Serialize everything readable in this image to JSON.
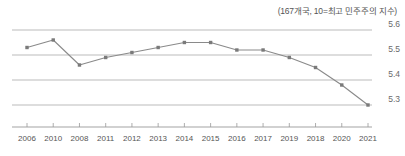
{
  "chart_data": {
    "type": "line",
    "title": "(167개국, 10=최고 민주주의 지수)",
    "xlabel": "",
    "ylabel": "",
    "categories": [
      "2006",
      "2010",
      "2008",
      "2011",
      "2012",
      "2013",
      "2014",
      "2015",
      "2016",
      "2017",
      "2019",
      "2018",
      "2020",
      "2021"
    ],
    "values": [
      5.53,
      5.56,
      5.46,
      5.49,
      5.51,
      5.53,
      5.55,
      5.55,
      5.52,
      5.52,
      5.49,
      5.45,
      5.38,
      5.3
    ],
    "ylim": [
      5.25,
      5.625
    ],
    "yticks": [
      "5.6",
      "5.5",
      "5.4",
      "5.3"
    ],
    "ytick_values": [
      5.6,
      5.5,
      5.4,
      5.3
    ],
    "grid": true,
    "legend": "none",
    "series": [
      {
        "name": "민주주의 지수",
        "values": [
          5.53,
          5.56,
          5.46,
          5.49,
          5.51,
          5.53,
          5.55,
          5.55,
          5.52,
          5.52,
          5.49,
          5.45,
          5.38,
          5.3
        ]
      }
    ],
    "colors": {
      "line": "#8a8a8a",
      "marker": "#7a7a7a",
      "grid": "#aaaaaa",
      "axis": "#999999",
      "text": "#555555"
    }
  }
}
